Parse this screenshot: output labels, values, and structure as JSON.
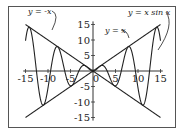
{
  "chart_data": {
    "type": "line",
    "title": "",
    "xlabel": "",
    "ylabel": "",
    "xlim": [
      -16,
      16
    ],
    "ylim": [
      -16,
      16
    ],
    "x_ticks": [
      -15,
      -10,
      -5,
      0,
      5,
      10,
      15
    ],
    "x_tick_labels": [
      "-15",
      "-10",
      "-5",
      "0",
      "5",
      "10",
      "15"
    ],
    "y_ticks": [
      15,
      10,
      5,
      -5,
      -10,
      -15
    ],
    "y_tick_labels": [
      "15",
      "10",
      "5",
      "-5",
      "-10",
      "-15"
    ],
    "grid": false,
    "legend": null,
    "series": [
      {
        "name": "y = x sin x",
        "function": "x*sin(x)",
        "domain": [
          -15,
          15
        ]
      },
      {
        "name": "y = x",
        "function": "x",
        "domain": [
          -15,
          15
        ]
      },
      {
        "name": "y = -x",
        "function": "-x",
        "domain": [
          -15,
          15
        ]
      }
    ],
    "annotations": [
      {
        "text": "y = -x",
        "target": "y = -x",
        "position": "top-left"
      },
      {
        "text": "y = x",
        "target": "y = x",
        "position": "upper-right-middle"
      },
      {
        "text": "y = x sin x",
        "target": "y = x sin x",
        "position": "top-right"
      }
    ]
  },
  "labels": {
    "neg_x": "y = -x",
    "pos_x": "y = x",
    "xsinx": "y = x sin x"
  }
}
